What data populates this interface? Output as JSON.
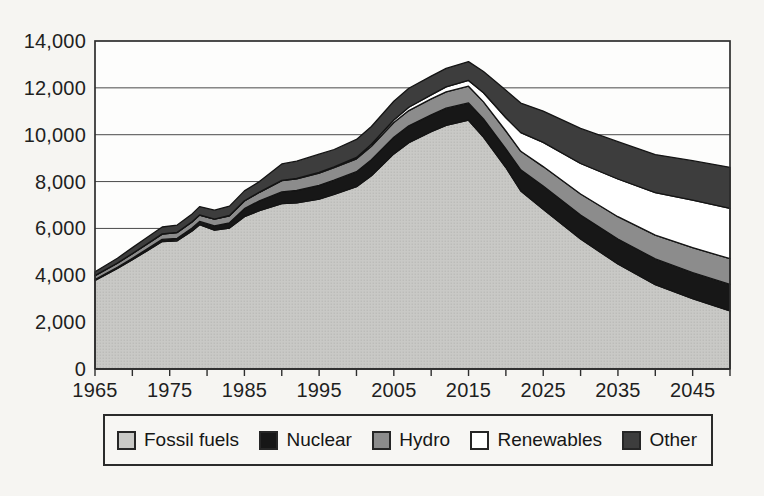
{
  "chart_data": {
    "type": "area",
    "stacked": true,
    "title": "",
    "xlabel": "",
    "ylabel": "",
    "xlim": [
      1965,
      2050
    ],
    "ylim": [
      0,
      14000
    ],
    "grid": "horizontal",
    "legend_position": "bottom",
    "x": [
      1965,
      1968,
      1970,
      1972,
      1974,
      1976,
      1978,
      1979,
      1981,
      1983,
      1985,
      1987,
      1990,
      1992,
      1995,
      1997,
      2000,
      2002,
      2005,
      2007,
      2010,
      2012,
      2015,
      2017,
      2020,
      2022,
      2025,
      2030,
      2035,
      2040,
      2045,
      2050
    ],
    "series": [
      {
        "name": "Fossil fuels",
        "color": "#c9c9c6",
        "dot_texture": "#b4b4b1",
        "values": [
          3780,
          4290,
          4670,
          5050,
          5440,
          5470,
          5890,
          6160,
          5930,
          6020,
          6500,
          6760,
          7060,
          7090,
          7250,
          7450,
          7780,
          8250,
          9180,
          9660,
          10130,
          10400,
          10620,
          9900,
          8600,
          7600,
          6820,
          5550,
          4480,
          3600,
          3000,
          2480
        ]
      },
      {
        "name": "Nuclear",
        "color": "#171717",
        "values": [
          40,
          50,
          60,
          75,
          90,
          110,
          130,
          140,
          180,
          220,
          340,
          420,
          500,
          530,
          590,
          610,
          640,
          680,
          710,
          720,
          720,
          730,
          740,
          770,
          800,
          900,
          990,
          1020,
          1070,
          1100,
          1120,
          1130
        ]
      },
      {
        "name": "Hydro",
        "color": "#8c8c8c",
        "values": [
          160,
          180,
          195,
          215,
          230,
          245,
          260,
          270,
          285,
          300,
          330,
          360,
          480,
          500,
          520,
          530,
          550,
          580,
          630,
          650,
          680,
          700,
          710,
          730,
          760,
          790,
          830,
          900,
          950,
          1010,
          1060,
          1100
        ]
      },
      {
        "name": "Renewables",
        "color": "#ffffff",
        "values": [
          5,
          5,
          5,
          5,
          5,
          5,
          5,
          5,
          5,
          10,
          10,
          10,
          15,
          20,
          30,
          40,
          60,
          80,
          110,
          140,
          170,
          210,
          250,
          390,
          560,
          800,
          1030,
          1300,
          1610,
          1820,
          2030,
          2150
        ]
      },
      {
        "name": "Other",
        "color": "#3d3d3d",
        "values": [
          165,
          205,
          250,
          275,
          295,
          310,
          335,
          355,
          380,
          405,
          420,
          450,
          700,
          730,
          780,
          740,
          770,
          760,
          800,
          810,
          800,
          790,
          800,
          910,
          1180,
          1260,
          1340,
          1500,
          1590,
          1620,
          1680,
          1750
        ]
      }
    ],
    "y_ticks": {
      "values": [
        0,
        2000,
        4000,
        6000,
        8000,
        10000,
        12000,
        14000
      ],
      "labels": [
        "0",
        "2,000",
        "4,000",
        "6,000",
        "8,000",
        "10,000",
        "12,000",
        "14,000"
      ]
    },
    "x_ticks": {
      "labeled_values": [
        1965,
        1975,
        1985,
        1995,
        2005,
        2015,
        2025,
        2035,
        2045
      ],
      "labels": [
        "1965",
        "1975",
        "1985",
        "1995",
        "2005",
        "2015",
        "2025",
        "2035",
        "2045"
      ],
      "minor_step": 5
    },
    "frame_color": "#2e2e2e",
    "gridline_color": "#4a4a4a",
    "band_edge_color": "#141414",
    "plot_background": "#fdfdfc"
  }
}
